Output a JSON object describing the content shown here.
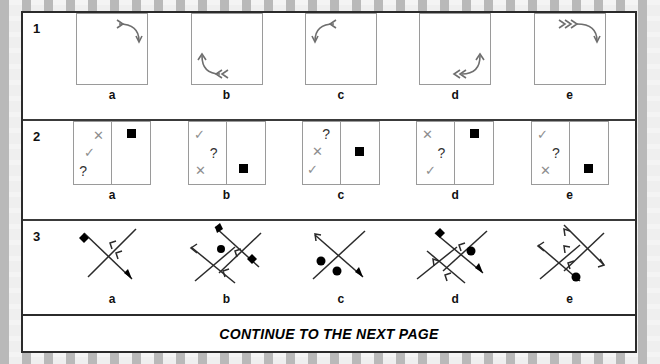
{
  "page": {
    "background_pattern": "brick-dashed-gray",
    "sheet_border_color": "#2b2b2b",
    "mark_color": "#8e8e8e",
    "ink_color": "#111111"
  },
  "footer": {
    "text": "CONTINUE TO THE NEXT PAGE"
  },
  "rows": [
    {
      "number": "1",
      "type": "curved-arrow-in-square",
      "options": [
        {
          "label": "a",
          "corner": "top-right",
          "barbs": 1,
          "arrow_dir": "down"
        },
        {
          "label": "b",
          "corner": "bottom-left",
          "barbs": 2,
          "arrow_dir": "up"
        },
        {
          "label": "c",
          "corner": "top-left",
          "barbs": 1,
          "arrow_dir": "down"
        },
        {
          "label": "d",
          "corner": "bottom-right",
          "barbs": 2,
          "arrow_dir": "up"
        },
        {
          "label": "e",
          "corner": "top-right",
          "barbs": 3,
          "arrow_dir": "down"
        }
      ]
    },
    {
      "number": "2",
      "type": "two-cell-symbol-box",
      "options": [
        {
          "label": "a",
          "left_marks": [
            {
              "glyph": "✕",
              "pos": "upper-right"
            },
            {
              "glyph": "✓",
              "pos": "middle-left"
            },
            {
              "glyph": "?",
              "pos": "lower-left"
            }
          ],
          "right_square": "top"
        },
        {
          "label": "b",
          "left_marks": [
            {
              "glyph": "✓",
              "pos": "upper-left"
            },
            {
              "glyph": "?",
              "pos": "middle-right"
            },
            {
              "glyph": "✕",
              "pos": "lower-left"
            }
          ],
          "right_square": "bottom"
        },
        {
          "label": "c",
          "left_marks": [
            {
              "glyph": "?",
              "pos": "upper-right"
            },
            {
              "glyph": "✕",
              "pos": "middle-left"
            },
            {
              "glyph": "✓",
              "pos": "lower-left"
            }
          ],
          "right_square": "middle"
        },
        {
          "label": "d",
          "left_marks": [
            {
              "glyph": "✕",
              "pos": "upper-left"
            },
            {
              "glyph": "?",
              "pos": "middle-right"
            },
            {
              "glyph": "✓",
              "pos": "lower-left"
            }
          ],
          "right_square": "top"
        },
        {
          "label": "e",
          "left_marks": [
            {
              "glyph": "✓",
              "pos": "upper-left"
            },
            {
              "glyph": "?",
              "pos": "middle-right"
            },
            {
              "glyph": "✕",
              "pos": "lower-left"
            }
          ],
          "right_square": "bottom"
        }
      ]
    },
    {
      "number": "3",
      "type": "crossed-lines-figure",
      "options": [
        {
          "label": "a",
          "diamonds": 1,
          "circles": 0,
          "arrows": 3,
          "line_pairs": 1
        },
        {
          "label": "b",
          "diamonds": 1,
          "circles": 1,
          "arrows": 4,
          "line_pairs": 2
        },
        {
          "label": "c",
          "diamonds": 0,
          "circles": 2,
          "arrows": 2,
          "line_pairs": 1
        },
        {
          "label": "d",
          "diamonds": 1,
          "circles": 1,
          "arrows": 4,
          "line_pairs": 2
        },
        {
          "label": "e",
          "diamonds": 0,
          "circles": 1,
          "arrows": 4,
          "line_pairs": 2
        }
      ]
    }
  ]
}
